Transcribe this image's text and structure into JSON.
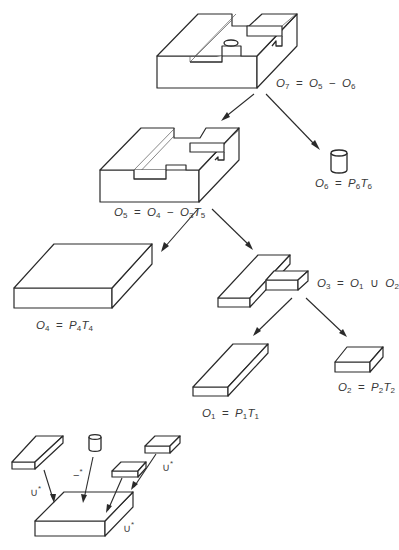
{
  "diagram": {
    "type": "csg-tree",
    "nodes": [
      {
        "id": "O7",
        "label": {
          "lhs": "O",
          "lhs_sub": "7",
          "parts": [
            {
              "t": "O",
              "s": "5"
            },
            {
              "op": "−"
            },
            {
              "t": "O",
              "s": "6"
            }
          ]
        },
        "shape": "final-part-with-hole"
      },
      {
        "id": "O5",
        "label": {
          "lhs": "O",
          "lhs_sub": "5",
          "parts": [
            {
              "t": "O",
              "s": "4"
            },
            {
              "op": "−"
            },
            {
              "t": "O",
              "s": "3"
            },
            {
              "t": "T",
              "s": "5"
            }
          ]
        },
        "shape": "block-with-T-slot"
      },
      {
        "id": "O6",
        "label": {
          "lhs": "O",
          "lhs_sub": "6",
          "parts": [
            {
              "t": "P",
              "s": "6"
            },
            {
              "t": "T",
              "s": "6"
            }
          ]
        },
        "shape": "cylinder"
      },
      {
        "id": "O4",
        "label": {
          "lhs": "O",
          "lhs_sub": "4",
          "parts": [
            {
              "t": "P",
              "s": "4"
            },
            {
              "t": "T",
              "s": "4"
            }
          ]
        },
        "shape": "slab"
      },
      {
        "id": "O3",
        "label": {
          "lhs": "O",
          "lhs_sub": "3",
          "parts": [
            {
              "t": "O",
              "s": "1"
            },
            {
              "op": "∪"
            },
            {
              "t": "O",
              "s": "2"
            }
          ]
        },
        "shape": "T-union"
      },
      {
        "id": "O1",
        "label": {
          "lhs": "O",
          "lhs_sub": "1",
          "parts": [
            {
              "t": "P",
              "s": "1"
            },
            {
              "t": "T",
              "s": "1"
            }
          ]
        },
        "shape": "long-bar"
      },
      {
        "id": "O2",
        "label": {
          "lhs": "O",
          "lhs_sub": "2",
          "parts": [
            {
              "t": "P",
              "s": "2"
            },
            {
              "t": "T",
              "s": "2"
            }
          ]
        },
        "shape": "short-block"
      }
    ],
    "edges": [
      {
        "from": "O7",
        "to": "O5"
      },
      {
        "from": "O7",
        "to": "O6"
      },
      {
        "from": "O5",
        "to": "O4"
      },
      {
        "from": "O5",
        "to": "O3"
      },
      {
        "from": "O3",
        "to": "O1"
      },
      {
        "from": "O3",
        "to": "O2"
      }
    ],
    "labels": {
      "o7": {
        "lhs": "O",
        "lhs_sub": "7",
        "eq": "=",
        "a": "O",
        "a_sub": "5",
        "op": "−",
        "b": "O",
        "b_sub": "6"
      },
      "o5": {
        "lhs": "O",
        "lhs_sub": "5",
        "eq": "=",
        "a": "O",
        "a_sub": "4",
        "op": "−",
        "b": "O",
        "b_sub": "3",
        "c": "T",
        "c_sub": "5"
      },
      "o6": {
        "lhs": "O",
        "lhs_sub": "6",
        "eq": "=",
        "a": "P",
        "a_sub": "6",
        "b": "T",
        "b_sub": "6"
      },
      "o4": {
        "lhs": "O",
        "lhs_sub": "4",
        "eq": "=",
        "a": "P",
        "a_sub": "4",
        "b": "T",
        "b_sub": "4"
      },
      "o3": {
        "lhs": "O",
        "lhs_sub": "3",
        "eq": "=",
        "a": "O",
        "a_sub": "1",
        "op": "∪",
        "b": "O",
        "b_sub": "2"
      },
      "o1": {
        "lhs": "O",
        "lhs_sub": "1",
        "eq": "=",
        "a": "P",
        "a_sub": "1",
        "b": "T",
        "b_sub": "1"
      },
      "o2": {
        "lhs": "O",
        "lhs_sub": "2",
        "eq": "=",
        "a": "P",
        "a_sub": "2",
        "b": "T",
        "b_sub": "2"
      }
    },
    "inset": {
      "description": "Equivalent flat form: primitives combined onto base slab",
      "op_labels": {
        "union_left": "∪",
        "union_left_sup": "*",
        "difference": "−",
        "difference_sup": "*",
        "union_right": "∪",
        "union_right_sup": "*",
        "union_base": "∪",
        "union_base_sup": "*"
      }
    }
  },
  "caption": {
    "text": ""
  },
  "colors": {
    "stroke": "#2a2a2a",
    "background": "#ffffff",
    "text": "#3a3a3a"
  }
}
